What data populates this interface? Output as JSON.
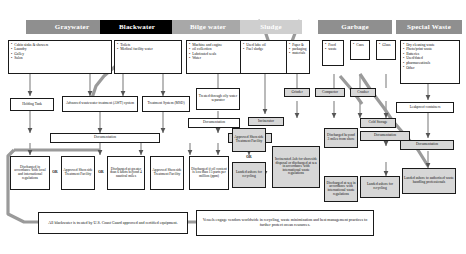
{
  "diagram": {
    "columns": [
      {
        "key": "graywater",
        "label": "Graywater",
        "style": "h-gray"
      },
      {
        "key": "blackwater",
        "label": "Blackwater",
        "style": "h-black"
      },
      {
        "key": "bilgewater",
        "label": "Bilge water",
        "style": "h-mid"
      },
      {
        "key": "sludge",
        "label": "Sludge",
        "style": "h-pale"
      },
      {
        "key": "garbage",
        "label": "Garbage",
        "style": "h-gray"
      },
      {
        "key": "specialwaste",
        "label": "Special Waste",
        "style": "h-gray"
      }
    ],
    "sources": {
      "graywater": [
        "Cabin sinks & showers",
        "Laundry",
        "Galley",
        "Salon"
      ],
      "blackwater": [
        "Toilets",
        "Medical facility water"
      ],
      "bilgewater": [
        "Machine and engine",
        "oil collection",
        "Lubricated seals",
        "Water"
      ],
      "sludge": [
        "Used lube oil",
        "Fuel sludge"
      ],
      "garbage_paper": [
        "Paper &",
        "packaging",
        "materials"
      ],
      "garbage_food": [
        "Food",
        "waste"
      ],
      "garbage_cans": [
        "Cans"
      ],
      "garbage_glass": [
        "Glass"
      ],
      "specialwaste": [
        "Dry cleaning waste",
        "Photo/print waste",
        "Batteries",
        "Used/dated",
        "pharmaceuticals",
        "Other"
      ]
    },
    "treatment": {
      "holding_tank": "Holding Tank",
      "awt": "Advanced wastewater treatment (AWT) system",
      "msd": "Treatment System (MSD)",
      "ows": "Treated through oily water separator",
      "grinder": "Grinder",
      "compactor": "Compactor",
      "crusher": "Crusher",
      "incinerator": "Incinerator",
      "cold_storage": "Cold Storage",
      "leakproof": "Leakproof containers"
    },
    "documentation_label": "Documentation",
    "documentation": {
      "wastewater": "Documentation",
      "bilge": "Documentation",
      "sludge": "Documentation",
      "garbage": "Documentation",
      "special": "Documentation"
    },
    "or_label": "OR",
    "outcomes": {
      "gray_discharge": "Discharged in accordance with local and international regulations",
      "gray_shoreside": "Approved Shoreside Treatment Facility",
      "black_discharge": "Discharged at greater than 6 knots beyond 4 nautical miles",
      "black_shoreside": "Approved Shoreside Treatment Facility",
      "bilge_discharge": "Discharged if oil content is less than 15 parts per million (ppm)",
      "sludge_shoreside": "Approved Shoreside Treatment Facility",
      "sludge_landed": "Landed ashore for recycling",
      "sludge_ash": "Incinerated Ash for shoreside disposal or discharged at sea in accordance with international waste regulations",
      "garbage_discharged": "Discharged beyond 3 miles from shore",
      "garbage_landed": "Landed ashore for recycling",
      "garbage_ash": "Discharged at sea in accordance with international waste regulations",
      "special_landed": "Landed ashore to authorized waste handling professionals"
    },
    "notes": {
      "blackwater_note": "All blackwater is treated by U.S. Coast Guard approved and certified equipment.",
      "recycling_note": "Vessels engage vendors worldwide in recycling, waste minimization and best management practices to further protect ocean resources."
    }
  }
}
